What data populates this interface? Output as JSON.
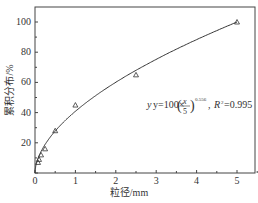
{
  "chart_data": {
    "type": "scatter",
    "title": "",
    "xlabel": "粒径/mm",
    "ylabel": "累积分布/%",
    "xlim": [
      0,
      5.15
    ],
    "ylim": [
      0,
      110
    ],
    "xticks": [
      "0",
      "1",
      "2",
      "3",
      "4",
      "5"
    ],
    "yticks": [
      "20",
      "40",
      "60",
      "80",
      "100"
    ],
    "grid": false,
    "series": [
      {
        "name": "measured",
        "marker": "triangle",
        "x": [
          0.075,
          0.1,
          0.15,
          0.25,
          0.5,
          1.0,
          2.5,
          5.0
        ],
        "y": [
          7,
          9,
          12,
          16,
          28,
          45,
          65,
          100
        ]
      },
      {
        "name": "fit",
        "type": "line",
        "equation": "y=100×(x/5)^0.556",
        "r2": "0.995"
      }
    ],
    "annotation": {
      "prefix": "y=100×",
      "frac_num": "x",
      "frac_den": "5",
      "exponent": "0.556",
      "r2_label": "R",
      "r2_sup": "2",
      "r2_value": "=0.995"
    }
  }
}
